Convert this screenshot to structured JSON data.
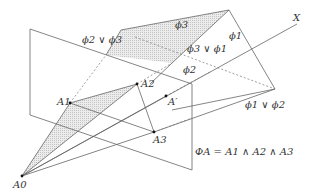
{
  "diagram": {
    "type": "geometric-planes",
    "colors": {
      "line": "#666666",
      "shade": "#d8d8d8",
      "point": "#111111",
      "text": "#333333"
    },
    "labels": {
      "axis_x": "X",
      "phi1": "ϕ1",
      "phi2": "ϕ2",
      "phi3": "ϕ3",
      "phi3_or_phi1": "ϕ3 ∨ ϕ1",
      "phi2_or_phi3": "ϕ2 ∨ ϕ3",
      "phi1_or_phi2": "ϕ1 ∨ ϕ2",
      "A0": "A0",
      "A1": "A1",
      "A2": "A2",
      "A3": "A3",
      "A_prime": "A′",
      "Phi_A": "ΦA = A1 ∧ A2 ∧ A3"
    },
    "points": {
      "A0": [
        22,
        176
      ],
      "A1": [
        70,
        103
      ],
      "A2": [
        137,
        84
      ],
      "A3": [
        154,
        132
      ],
      "A_prime": [
        166,
        96
      ]
    }
  }
}
